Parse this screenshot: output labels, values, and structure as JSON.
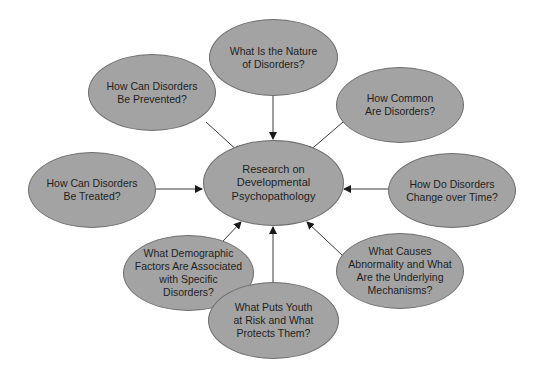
{
  "diagram": {
    "type": "hub-and-spoke",
    "colors": {
      "node_fill": "#a3a3a3",
      "node_stroke": "#6e6e6e",
      "arrow": "#2a2a2a",
      "background": "#ffffff",
      "text": "#1f1f1f"
    },
    "center": {
      "label": "Research on\nDevelopmental\nPsychopathology"
    },
    "spokes": [
      {
        "id": "nature",
        "label": "What Is the Nature\nof Disorders?"
      },
      {
        "id": "common",
        "label": "How Common\nAre Disorders?"
      },
      {
        "id": "change",
        "label": "How Do Disorders\nChange over Time?"
      },
      {
        "id": "causes",
        "label": "What Causes\nAbnormality and What\nAre the Underlying\nMechanisms?"
      },
      {
        "id": "risk",
        "label": "What Puts Youth\nat Risk and What\nProtects Them?"
      },
      {
        "id": "demographic",
        "label": "What Demographic\nFactors Are Associated\nwith Specific\nDisorders?"
      },
      {
        "id": "treated",
        "label": "How Can Disorders\nBe Treated?"
      },
      {
        "id": "prevented",
        "label": "How Can Disorders\nBe Prevented?"
      }
    ],
    "edges": [
      {
        "from": "nature",
        "to": "center"
      },
      {
        "from": "common",
        "to": "center"
      },
      {
        "from": "change",
        "to": "center"
      },
      {
        "from": "causes",
        "to": "center"
      },
      {
        "from": "risk",
        "to": "center"
      },
      {
        "from": "demographic",
        "to": "center"
      },
      {
        "from": "treated",
        "to": "center"
      },
      {
        "from": "prevented",
        "to": "center"
      }
    ]
  }
}
